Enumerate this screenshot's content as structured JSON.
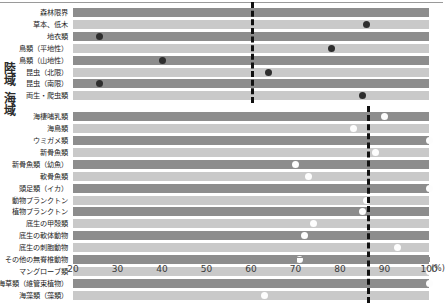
{
  "chart_data": {
    "type": "bar",
    "title": "",
    "xlabel": "%",
    "ylabel": "",
    "xlim": [
      20,
      100
    ],
    "xticks": [
      20,
      30,
      40,
      50,
      60,
      70,
      80,
      90,
      100
    ],
    "xtick_labels": [
      "20",
      "30",
      "40",
      "50",
      "60",
      "70",
      "80",
      "90",
      "100"
    ],
    "axis_unit": "(%)",
    "grid": false,
    "legend": "none",
    "groups": [
      {
        "name": "陸域",
        "threshold": 60,
        "threshold_style": "dashed",
        "marker_color": "#2e2e2e",
        "categories": [
          {
            "label": "森林限界",
            "bar": "dark",
            "value": null
          },
          {
            "label": "草本、低木",
            "bar": "light",
            "value": 86
          },
          {
            "label": "地衣類",
            "bar": "dark",
            "value": 26
          },
          {
            "label": "鳥類（平地性）",
            "bar": "light",
            "value": 78
          },
          {
            "label": "鳥類（山地性）",
            "bar": "dark",
            "value": 40
          },
          {
            "label": "昆虫（北限）",
            "bar": "light",
            "value": 64
          },
          {
            "label": "昆虫（南限）",
            "bar": "dark",
            "value": 26
          },
          {
            "label": "両生・爬虫類",
            "bar": "light",
            "value": 85
          }
        ]
      },
      {
        "name": "海域",
        "threshold": 86,
        "threshold_style": "dashed",
        "marker_color": "#fdfdfd",
        "categories": [
          {
            "label": "海棲哺乳類",
            "bar": "dark",
            "value": 90
          },
          {
            "label": "海鳥類",
            "bar": "light",
            "value": 83
          },
          {
            "label": "ウミガメ類",
            "bar": "dark",
            "value": 100
          },
          {
            "label": "新骨魚類",
            "bar": "light",
            "value": 88
          },
          {
            "label": "新骨魚類（幼魚）",
            "bar": "dark",
            "value": 70
          },
          {
            "label": "軟骨魚類",
            "bar": "light",
            "value": 73
          },
          {
            "label": "頭足類（イカ）",
            "bar": "dark",
            "value": 100
          },
          {
            "label": "動物プランクトン",
            "bar": "light",
            "value": 86
          },
          {
            "label": "植物プランクトン",
            "bar": "dark",
            "value": 85
          },
          {
            "label": "底生の甲殻類",
            "bar": "light",
            "value": 74
          },
          {
            "label": "底生の軟体動物",
            "bar": "dark",
            "value": 72
          },
          {
            "label": "底生の刺胞動物",
            "bar": "light",
            "value": 93
          },
          {
            "label": "その他の無脊椎動物",
            "bar": "dark",
            "value": 71
          },
          {
            "label": "マングローブ類",
            "bar": "light",
            "value": 100
          },
          {
            "label": "海草類（維管束植物）",
            "bar": "dark",
            "value": 100
          },
          {
            "label": "海藻類（藻類）",
            "bar": "light",
            "value": 63
          }
        ]
      }
    ]
  }
}
